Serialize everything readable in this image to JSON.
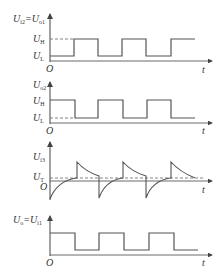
{
  "diagram": {
    "type": "waveform-timing-diagram",
    "panels": [
      {
        "id": "panel1",
        "y_label": {
          "main": "U",
          "sub": "i2",
          "eq": "=",
          "main2": "U",
          "sub2": "o1"
        },
        "level_labels": [
          {
            "main": "U",
            "sub": "H"
          },
          {
            "main": "U",
            "sub": "L"
          }
        ],
        "origin_label": "O",
        "x_label": "t",
        "waveform": "square, starts low, rises at ~1/6, period ~2/6"
      },
      {
        "id": "panel2",
        "y_label": {
          "main": "U",
          "sub": "o2"
        },
        "level_labels": [
          {
            "main": "U",
            "sub": "H"
          },
          {
            "main": "U",
            "sub": "L"
          }
        ],
        "origin_label": "O",
        "x_label": "t",
        "waveform": "inverted square, starts high"
      },
      {
        "id": "panel3",
        "y_label": {
          "main": "U",
          "sub": "i3"
        },
        "level_labels": [
          {
            "main": "U",
            "sub": "T"
          }
        ],
        "origin_label": "O",
        "x_label": "t",
        "waveform": "RC differentiator spikes with exponential decay toward threshold"
      },
      {
        "id": "panel4",
        "y_label": {
          "main": "U",
          "sub": "o",
          "eq": "=",
          "main2": "U",
          "sub2": "i1"
        },
        "origin_label": "O",
        "x_label": "t",
        "waveform": "square, starts high"
      }
    ],
    "colors": {
      "line": "#555555",
      "text": "#333333",
      "background": "#ffffff"
    }
  }
}
